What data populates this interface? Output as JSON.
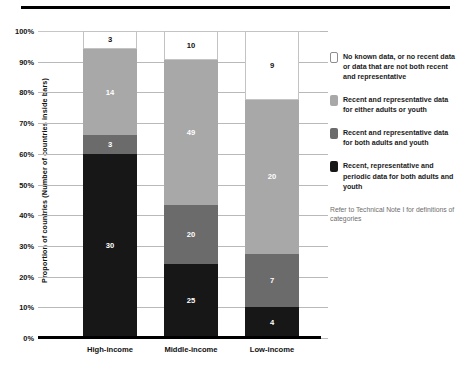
{
  "chart_data": {
    "type": "bar",
    "subtype": "stacked-percentage",
    "title": "",
    "xlabel": "",
    "ylabel": "Proportion of countries (Number of countries inside bars)",
    "ylim": [
      0,
      100
    ],
    "ytick_labels": [
      "100%",
      "90%",
      "80%",
      "70%",
      "60%",
      "50%",
      "40%",
      "30%",
      "20%",
      "10%",
      "0%"
    ],
    "ytick_values": [
      100,
      90,
      80,
      70,
      60,
      50,
      40,
      30,
      20,
      10,
      0
    ],
    "grid": true,
    "legend_position": "right",
    "categories": [
      "High-income",
      "Middle-income",
      "Low-income"
    ],
    "category_totals": [
      50,
      104,
      40
    ],
    "series": [
      {
        "name": "Recent, representative and periodic data for both adults and youth",
        "color": "#171717",
        "swatch": "dark",
        "values": [
          30,
          25,
          4
        ],
        "percent": [
          60.0,
          24.0,
          10.0
        ]
      },
      {
        "name": "Recent and representative data for both adults and youth",
        "color": "#6b6b6b",
        "swatch": "medium",
        "values": [
          3,
          20,
          7
        ],
        "percent": [
          6.0,
          19.2,
          17.5
        ]
      },
      {
        "name": "Recent and representative data for either adults or youth",
        "color": "#a8a8a8",
        "swatch": "light",
        "values": [
          14,
          49,
          20
        ],
        "percent": [
          28.0,
          47.1,
          50.0
        ]
      },
      {
        "name": "No known data, or no recent data or data that are not both recent and representative",
        "color": "#ffffff",
        "swatch": "white",
        "values": [
          3,
          10,
          9
        ],
        "percent": [
          6.0,
          9.6,
          22.5
        ]
      }
    ],
    "bars": [
      {
        "category": "High-income",
        "segments": [
          {
            "label": "3",
            "value": 3,
            "percent": 6.0,
            "swatch": "white"
          },
          {
            "label": "14",
            "value": 14,
            "percent": 28.0,
            "swatch": "light"
          },
          {
            "label": "3",
            "value": 3,
            "percent": 6.0,
            "swatch": "medium"
          },
          {
            "label": "30",
            "value": 30,
            "percent": 60.0,
            "swatch": "dark"
          }
        ]
      },
      {
        "category": "Middle-income",
        "segments": [
          {
            "label": "10",
            "value": 10,
            "percent": 9.6,
            "swatch": "white"
          },
          {
            "label": "49",
            "value": 49,
            "percent": 47.1,
            "swatch": "light"
          },
          {
            "label": "20",
            "value": 20,
            "percent": 19.2,
            "swatch": "medium"
          },
          {
            "label": "25",
            "value": 25,
            "percent": 24.0,
            "swatch": "dark"
          }
        ]
      },
      {
        "category": "Low-income",
        "segments": [
          {
            "label": "9",
            "value": 9,
            "percent": 22.5,
            "swatch": "white"
          },
          {
            "label": "20",
            "value": 20,
            "percent": 50.0,
            "swatch": "light"
          },
          {
            "label": "7",
            "value": 7,
            "percent": 17.5,
            "swatch": "medium"
          },
          {
            "label": "4",
            "value": 4,
            "percent": 10.0,
            "swatch": "dark"
          }
        ]
      }
    ],
    "legend": {
      "items": [
        {
          "swatch": "white",
          "text": "No known data, or no recent data or data that are not both recent and representative"
        },
        {
          "swatch": "light",
          "text": "Recent and representative data for either adults or youth"
        },
        {
          "swatch": "medium",
          "text": "Recent and representative data for both adults and youth"
        },
        {
          "swatch": "dark",
          "text": "Recent, representative and periodic data for both adults and youth"
        }
      ],
      "note": "Refer to Technical Note I for definitions of categories"
    },
    "colors": {
      "white": "#ffffff",
      "light": "#a8a8a8",
      "medium": "#6b6b6b",
      "dark": "#171717",
      "grid": "#b9b9b9",
      "axis": "#000000",
      "text": "#111111",
      "note_text": "#6e6e6e"
    }
  }
}
